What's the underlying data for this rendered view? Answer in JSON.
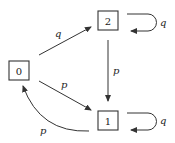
{
  "diagram": {
    "type": "state-transition-graph",
    "nodes": [
      {
        "id": "0",
        "label": "0"
      },
      {
        "id": "1",
        "label": "1"
      },
      {
        "id": "2",
        "label": "2"
      }
    ],
    "edges": [
      {
        "from": "0",
        "to": "2",
        "label": "q"
      },
      {
        "from": "0",
        "to": "1",
        "label": "p"
      },
      {
        "from": "2",
        "to": "1",
        "label": "p"
      },
      {
        "from": "1",
        "to": "0",
        "label": "p"
      },
      {
        "from": "2",
        "to": "2",
        "label": "q"
      },
      {
        "from": "1",
        "to": "1",
        "label": "q"
      }
    ]
  }
}
